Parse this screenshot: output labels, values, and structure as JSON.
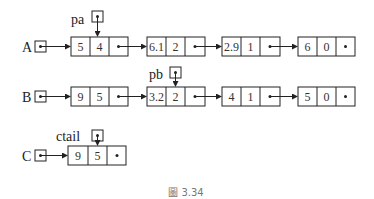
{
  "figure": {
    "caption": "圖 3.34",
    "colors": {
      "stroke": "#222222",
      "caption": "#777777"
    }
  },
  "pointers": {
    "A": {
      "label": "A"
    },
    "B": {
      "label": "B"
    },
    "C": {
      "label": "C"
    },
    "pa": {
      "label": "pa",
      "points_to": "A.node1.exp"
    },
    "pb": {
      "label": "pb",
      "points_to": "B.node2.exp"
    },
    "ctail": {
      "label": "ctail",
      "points_to": "C.node1.exp"
    }
  },
  "lists": {
    "A": {
      "nodes": [
        {
          "coef": "5",
          "exp": "4",
          "link": "•"
        },
        {
          "coef": "6.1",
          "exp": "2",
          "link": "•"
        },
        {
          "coef": "2.9",
          "exp": "1",
          "link": "•"
        },
        {
          "coef": "6",
          "exp": "0",
          "link": "•"
        }
      ]
    },
    "B": {
      "nodes": [
        {
          "coef": "9",
          "exp": "5",
          "link": "•"
        },
        {
          "coef": "3.2",
          "exp": "2",
          "link": "•"
        },
        {
          "coef": "4",
          "exp": "1",
          "link": "•"
        },
        {
          "coef": "5",
          "exp": "0",
          "link": "•"
        }
      ]
    },
    "C": {
      "nodes": [
        {
          "coef": "9",
          "exp": "5",
          "link": "•"
        }
      ]
    }
  }
}
